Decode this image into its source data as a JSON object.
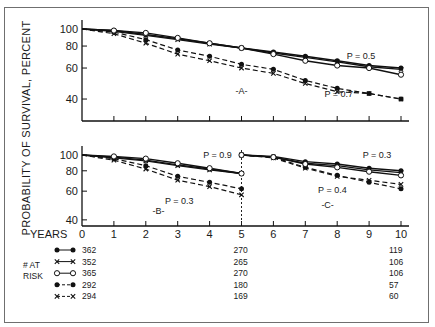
{
  "chart_data": {
    "type": "line",
    "ylabel": "PROBABILITY OF SURVIVAL, PERCENT",
    "xlabel": "YEARS",
    "yscale": "log",
    "ylim": [
      35,
      105
    ],
    "yticks": [
      100,
      80,
      60,
      40
    ],
    "xticks": [
      0,
      1,
      2,
      3,
      4,
      5,
      6,
      7,
      8,
      9,
      10
    ],
    "series_styles": [
      {
        "id": "s1",
        "line": "solid",
        "marker": "filled-circle"
      },
      {
        "id": "s2",
        "line": "solid",
        "marker": "x"
      },
      {
        "id": "s3",
        "line": "solid",
        "marker": "open-circle"
      },
      {
        "id": "s4",
        "line": "dashed",
        "marker": "filled-circle"
      },
      {
        "id": "s5",
        "line": "dashed",
        "marker": "x"
      }
    ],
    "panels": [
      {
        "label": "-A-",
        "xlim": [
          0,
          10
        ],
        "annotations": [
          {
            "text": "P = 0.5",
            "x": 8.3,
            "y": 70
          },
          {
            "text": "P = 0.7",
            "x": 7.6,
            "y": 43
          }
        ],
        "series": [
          {
            "id": "s1",
            "x": [
              0,
              1,
              2,
              3,
              4,
              5,
              6,
              7,
              8,
              9,
              10
            ],
            "values": [
              100,
              98,
              93,
              88,
              83,
              78,
              74,
              70,
              66,
              62,
              60
            ]
          },
          {
            "id": "s2",
            "x": [
              0,
              1,
              2,
              3,
              4,
              5,
              6,
              7,
              8,
              9,
              10
            ],
            "values": [
              100,
              97,
              92,
              87,
              82,
              78,
              73,
              69,
              65,
              61,
              59
            ]
          },
          {
            "id": "s3",
            "x": [
              0,
              1,
              2,
              3,
              4,
              5,
              6,
              7,
              8,
              9,
              10
            ],
            "values": [
              100,
              98,
              95,
              89,
              83,
              78,
              72,
              66,
              62,
              60,
              55
            ]
          },
          {
            "id": "s4",
            "x": [
              0,
              1,
              2,
              3,
              4,
              5,
              6,
              7,
              8,
              9,
              10
            ],
            "values": [
              100,
              96,
              87,
              76,
              70,
              63,
              59,
              51,
              46,
              43,
              40
            ]
          },
          {
            "id": "s5",
            "x": [
              0,
              1,
              2,
              3,
              4,
              5,
              6,
              7,
              8,
              9,
              10
            ],
            "values": [
              100,
              94,
              83,
              72,
              66,
              60,
              56,
              49,
              44,
              43,
              40
            ]
          }
        ]
      },
      {
        "label": "-B-",
        "xlim": [
          0,
          5
        ],
        "annotations": [
          {
            "text": "P = 0.9",
            "x": 3.8,
            "y": 100
          },
          {
            "text": "P = 0.3",
            "x": 2.6,
            "y": 52
          }
        ],
        "series": [
          {
            "id": "s1",
            "x": [
              0,
              1,
              2,
              3,
              4,
              5
            ],
            "values": [
              100,
              97,
              93,
              87,
              82,
              77
            ]
          },
          {
            "id": "s2",
            "x": [
              0,
              1,
              2,
              3,
              4,
              5
            ],
            "values": [
              100,
              96,
              92,
              86,
              81,
              77
            ]
          },
          {
            "id": "s3",
            "x": [
              0,
              1,
              2,
              3,
              4,
              5
            ],
            "values": [
              100,
              98,
              95,
              89,
              83,
              77
            ]
          },
          {
            "id": "s4",
            "x": [
              0,
              1,
              2,
              3,
              4,
              5
            ],
            "values": [
              100,
              95,
              86,
              74,
              68,
              62
            ]
          },
          {
            "id": "s5",
            "x": [
              0,
              1,
              2,
              3,
              4,
              5
            ],
            "values": [
              100,
              93,
              82,
              70,
              64,
              57
            ]
          }
        ]
      },
      {
        "label": "-C-",
        "xlim": [
          5,
          10
        ],
        "annotations": [
          {
            "text": "P = 0.3",
            "x": 8.8,
            "y": 100
          },
          {
            "text": "P = 0.4",
            "x": 7.4,
            "y": 61
          }
        ],
        "series": [
          {
            "id": "s1",
            "x": [
              5,
              6,
              7,
              8,
              9,
              10
            ],
            "values": [
              100,
              98,
              91,
              88,
              83,
              80
            ]
          },
          {
            "id": "s2",
            "x": [
              5,
              6,
              7,
              8,
              9,
              10
            ],
            "values": [
              100,
              97,
              89,
              86,
              81,
              78
            ]
          },
          {
            "id": "s3",
            "x": [
              5,
              6,
              7,
              8,
              9,
              10
            ],
            "values": [
              100,
              97,
              88,
              84,
              79,
              75
            ]
          },
          {
            "id": "s4",
            "x": [
              5,
              6,
              7,
              8,
              9,
              10
            ],
            "values": [
              100,
              97,
              84,
              75,
              68,
              62
            ]
          },
          {
            "id": "s5",
            "x": [
              5,
              6,
              7,
              8,
              9,
              10
            ],
            "values": [
              100,
              96,
              83,
              74,
              70,
              66
            ]
          }
        ]
      }
    ],
    "at_risk": {
      "label_line1": "# AT",
      "label_line2": "RISK",
      "years": [
        0,
        5,
        10
      ],
      "rows": [
        {
          "id": "s1",
          "values": [
            "362",
            "270",
            "119"
          ]
        },
        {
          "id": "s2",
          "values": [
            "352",
            "265",
            "106"
          ]
        },
        {
          "id": "s3",
          "values": [
            "365",
            "270",
            "106"
          ]
        },
        {
          "id": "s4",
          "values": [
            "292",
            "180",
            "57"
          ]
        },
        {
          "id": "s5",
          "values": [
            "294",
            "169",
            "60"
          ]
        }
      ]
    }
  }
}
